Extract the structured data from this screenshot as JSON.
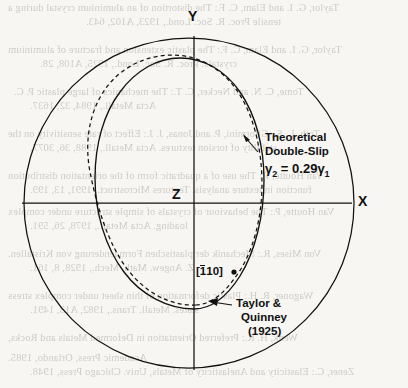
{
  "figure": {
    "kind": "stereographic-projection-diagram",
    "background_color": "#f7f6f3",
    "ink_color": "#111111"
  },
  "axes": {
    "y_label": "Y",
    "x_label": "X",
    "z_label": "Z"
  },
  "annotations": {
    "theoretical": {
      "line1": "Theoretical",
      "line2": "Double-Slip",
      "formula_gamma": "γ",
      "formula_sub2": "2",
      "formula_eq": " = 0.29",
      "formula_sub1": "1"
    },
    "experiment": {
      "line1": "Taylor &",
      "line2": "Quinney",
      "line3": "(1925)"
    },
    "point": {
      "bracket_open": "[",
      "overbar_digit": "1",
      "rest": "10",
      "bracket_close": "]"
    }
  },
  "curves": {
    "outer_circle": "reference-circle",
    "solid_curve": "taylor-quinney-1925",
    "dashed_curve": "theoretical-double-slip"
  },
  "bleed_text": {
    "lines": [
      "Taylor, G. I. and Elam, C. F.: The distortion of an aluminium crystal during a",
      "tensile Proc. R. Soc. Lond., 1923, A102, 643.",
      "Taylor, G. I. and Elam, C. F.: The plastic extension and fracture of aluminium",
      "crystals. Proc. R. Soc. Lond., 1925, A108, 28.",
      "Tome, C. N. and Necker, C. T.: The mechanics of large plastic P. C.",
      "Acta Metall., 1984, 32, 1637.",
      "Toth, L. S., Gilormini, P. and Jonas, J. J.: Effect of rate sensitivity on the",
      "stability of torsion textures. Acta Metall., 1988, 36, 3077.",
      "Van Houtte, P.: The use of a quadratic form of the orientation distribution",
      "function in texture analysis. Textures Microstruct., 1991, 13, 199.",
      "Van Houtte, P.: The behaviour of crystals of simple structure under complex",
      "loading. Acta Metall., 1978, 26, 591.",
      "Von Mises, R.: Mechanik der plastischen Formaenderung von Kristallen.",
      "Z. Angew. Math. Mech., 1928, 8, 161.",
      "Wagoner, R. H.: Plastic deformation of thin sheet under complex stress",
      "states. Metall. Trans., 1982, A13, 1491.",
      "Wenk, H. R.: Preferred Orientation in Deformed Metals and Rocks,",
      "Academic Press, Orlando, 1985.",
      "Zener, C.: Elasticity and Anelasticity of Metals, Univ. Chicago Press, 1948.",
      "Zhou, Y. and Neale, K. W.: Predictions of forming limit diagrams using a",
      "rate-sensitive crystal plasticity model. Int. J. Mech. Sci., 1995, 37, 1.",
      "Zhou, Y., Neale, K. W. and Toth, L. S.: A modified model for simulating",
      "latent hardening during the plastic deformation of rate-dependent f.c.c.",
      "polycrystals. Int. J. Plast., 1993, 9, 961."
    ]
  }
}
